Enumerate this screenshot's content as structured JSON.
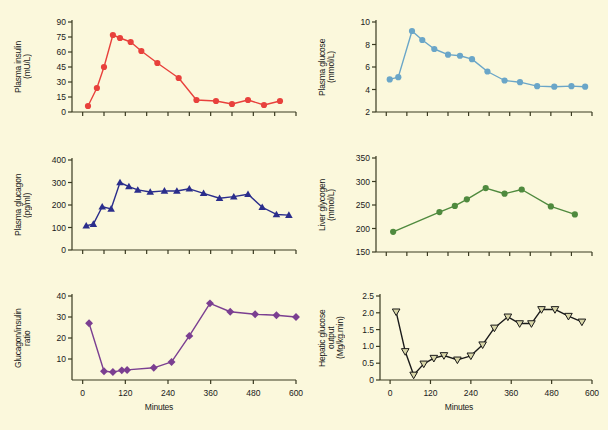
{
  "figure": {
    "background": "#fbf8dc",
    "width": 608,
    "height": 430,
    "xlabel": "Minutes"
  },
  "chart_data": [
    {
      "id": "plasma-insulin",
      "type": "line",
      "title": "",
      "ylabel": "Plasma insulin",
      "ylabel_units": "(mU/L)",
      "xlabel": "",
      "color": "#e8413c",
      "marker": "circle",
      "ylim": [
        0,
        90
      ],
      "yticks": [
        0,
        15,
        30,
        45,
        60,
        75,
        90
      ],
      "xlim": [
        -30,
        600
      ],
      "xticks": [
        0,
        60,
        120,
        180,
        240,
        300,
        360,
        420,
        480,
        540,
        600
      ],
      "xticklabels": [
        "",
        "",
        "",
        "",
        "",
        "",
        "",
        "",
        "",
        "",
        ""
      ],
      "grid": false,
      "x": [
        15,
        40,
        60,
        85,
        105,
        135,
        165,
        210,
        270,
        320,
        375,
        420,
        465,
        510,
        555
      ],
      "values": [
        6,
        24,
        45,
        77,
        74,
        70,
        61,
        49,
        34,
        12,
        11,
        8,
        12,
        7,
        11
      ]
    },
    {
      "id": "plasma-glucose",
      "type": "line",
      "title": "",
      "ylabel": "Plasma glucose",
      "ylabel_units": "(mmol/L)",
      "xlabel": "",
      "color": "#6aa6c8",
      "marker": "circle",
      "ylim": [
        2,
        10
      ],
      "yticks": [
        2,
        4,
        6,
        8,
        10
      ],
      "xlim": [
        -30,
        600
      ],
      "xticks": [
        0,
        60,
        120,
        180,
        240,
        300,
        360,
        420,
        480,
        540,
        600
      ],
      "xticklabels": [
        "",
        "",
        "",
        "",
        "",
        "",
        "",
        "",
        "",
        "",
        ""
      ],
      "grid": false,
      "x": [
        10,
        35,
        75,
        105,
        140,
        180,
        215,
        250,
        295,
        345,
        390,
        440,
        490,
        540,
        580
      ],
      "values": [
        4.9,
        5.1,
        9.2,
        8.4,
        7.6,
        7.1,
        7.0,
        6.7,
        5.6,
        4.8,
        4.65,
        4.3,
        4.25,
        4.3,
        4.25
      ]
    },
    {
      "id": "plasma-glucagon",
      "type": "line",
      "title": "",
      "ylabel": "Plasma glucagon",
      "ylabel_units": "(pg/ml)",
      "xlabel": "",
      "color": "#2b2e8c",
      "marker": "triangle-up",
      "ylim": [
        0,
        400
      ],
      "yticks": [
        0,
        100,
        200,
        300,
        400
      ],
      "xlim": [
        -30,
        600
      ],
      "xticks": [
        0,
        60,
        120,
        180,
        240,
        300,
        360,
        420,
        480,
        540,
        600
      ],
      "xticklabels": [
        "",
        "",
        "",
        "",
        "",
        "",
        "",
        "",
        "",
        "",
        ""
      ],
      "grid": false,
      "x": [
        10,
        30,
        55,
        80,
        105,
        130,
        155,
        190,
        230,
        265,
        300,
        340,
        385,
        425,
        465,
        505,
        545,
        580
      ],
      "values": [
        108,
        115,
        192,
        183,
        300,
        282,
        267,
        258,
        263,
        262,
        272,
        252,
        230,
        237,
        248,
        190,
        158,
        155
      ]
    },
    {
      "id": "liver-glycogen",
      "type": "line",
      "title": "",
      "ylabel": "Liver glycogen",
      "ylabel_units": "(mmol/L)",
      "xlabel": "",
      "color": "#4f8a3e",
      "marker": "circle",
      "ylim": [
        150,
        350
      ],
      "yticks": [
        150,
        200,
        250,
        300,
        350
      ],
      "xlim": [
        -30,
        600
      ],
      "xticks": [
        0,
        60,
        120,
        180,
        240,
        300,
        360,
        420,
        480,
        540,
        600
      ],
      "xticklabels": [
        "",
        "",
        "",
        "",
        "",
        "",
        "",
        "",
        "",
        "",
        ""
      ],
      "grid": false,
      "x": [
        20,
        155,
        200,
        235,
        290,
        345,
        395,
        480,
        550
      ],
      "values": [
        193,
        235,
        248,
        262,
        286,
        274,
        283,
        247,
        230
      ]
    },
    {
      "id": "glucagon-insulin-ratio",
      "type": "line",
      "title": "",
      "ylabel": "Glucagon/insulin",
      "ylabel_units": "ratio",
      "xlabel": "Minutes",
      "color": "#7b3f91",
      "marker": "diamond",
      "ylim": [
        0,
        40
      ],
      "yticks": [
        10,
        20,
        30,
        40
      ],
      "xlim": [
        -30,
        600
      ],
      "xticks": [
        0,
        120,
        240,
        360,
        480,
        600
      ],
      "xticklabels": [
        "0",
        "120",
        "240",
        "360",
        "480",
        "600"
      ],
      "grid": false,
      "x": [
        18,
        60,
        85,
        110,
        125,
        200,
        250,
        300,
        358,
        415,
        485,
        545,
        600
      ],
      "values": [
        27,
        4.2,
        3.8,
        4.6,
        4.8,
        5.8,
        8.6,
        21,
        36.5,
        32.5,
        31.3,
        30.8,
        30
      ]
    },
    {
      "id": "hepatic-glucose-output",
      "type": "line",
      "title": "",
      "ylabel": "Hepatic glucose",
      "ylabel_units": "output\n(Mg/kg.min)",
      "ylabel_line2": "output",
      "ylabel_line3": "(Mg/kg.min)",
      "xlabel": "Minutes",
      "color": "#1a1a1a",
      "marker": "triangle-down",
      "ylim": [
        0,
        2.5
      ],
      "yticks": [
        0,
        0.5,
        1.0,
        1.5,
        2.0,
        2.5
      ],
      "yticklabels": [
        "0",
        "0.5",
        "1.0",
        "1.5",
        "2.0",
        "2.5"
      ],
      "xlim": [
        -30,
        600
      ],
      "xticks": [
        0,
        120,
        240,
        360,
        480,
        600
      ],
      "xticklabels": [
        "0",
        "120",
        "240",
        "360",
        "480",
        "600"
      ],
      "grid": false,
      "x": [
        18,
        45,
        70,
        100,
        130,
        160,
        200,
        240,
        275,
        310,
        350,
        385,
        420,
        450,
        490,
        530,
        570
      ],
      "values": [
        2.03,
        0.85,
        0.15,
        0.48,
        0.65,
        0.73,
        0.6,
        0.72,
        1.05,
        1.55,
        1.88,
        1.68,
        1.68,
        2.1,
        2.1,
        1.9,
        1.73
      ]
    }
  ]
}
